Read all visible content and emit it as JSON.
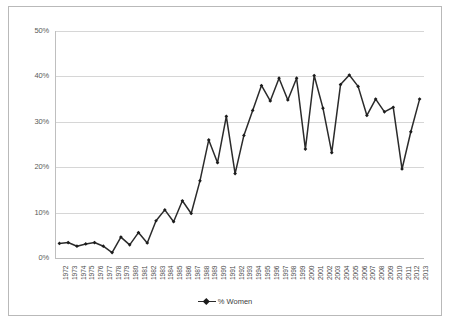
{
  "chart_data": {
    "type": "line",
    "title": "",
    "subtitle": "",
    "xlabel": "",
    "ylabel": "",
    "ylim": [
      0,
      50
    ],
    "ytick_labels": [
      "0%",
      "10%",
      "20%",
      "30%",
      "40%",
      "50%"
    ],
    "ytick_values": [
      0,
      10,
      20,
      30,
      40,
      50
    ],
    "grid": true,
    "legend_position": "bottom-center",
    "legend_entries": [
      "% Women"
    ],
    "marker": "diamond",
    "line_color": "#2b2b2b",
    "marker_color": "#1c1c1c",
    "grid_color": "#d6d6d6",
    "categories": [
      "1972",
      "1973",
      "1974",
      "1975",
      "1976",
      "1977",
      "1978",
      "1979",
      "1980",
      "1981",
      "1982",
      "1983",
      "1984",
      "1985",
      "1986",
      "1987",
      "1988",
      "1989",
      "1990",
      "1991",
      "1992",
      "1993",
      "1994",
      "1995",
      "1996",
      "1997",
      "1998",
      "1999",
      "2000",
      "2001",
      "2002",
      "2003",
      "2004",
      "2005",
      "2006",
      "2007",
      "2008",
      "2009",
      "2010",
      "2011",
      "2012",
      "2013"
    ],
    "series": [
      {
        "name": "% Women",
        "values": [
          3.2,
          3.4,
          2.6,
          3.1,
          3.4,
          2.6,
          1.2,
          4.6,
          2.9,
          5.6,
          3.3,
          8.2,
          10.6,
          8.0,
          12.6,
          9.8,
          17.0,
          26.0,
          21.0,
          31.2,
          18.6,
          27.0,
          32.5,
          38.0,
          34.6,
          39.6,
          34.8,
          39.6,
          24.0,
          40.2,
          33.0,
          23.2,
          38.2,
          40.3,
          37.8,
          31.4,
          35.0,
          32.2,
          33.2,
          19.6,
          27.8,
          35.0
        ]
      }
    ]
  },
  "layout": {
    "plot_left": 55,
    "plot_right": 424,
    "plot_top": 31,
    "plot_bottom": 258
  }
}
